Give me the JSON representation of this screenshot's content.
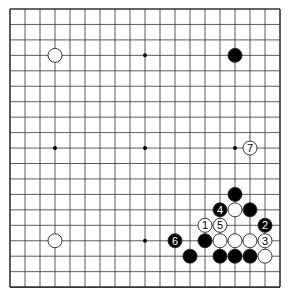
{
  "diagram": {
    "type": "go-board",
    "size": 19,
    "geometry": {
      "x0": 10,
      "y0": 9,
      "dx": 15.0,
      "dy": 15.45,
      "stone_radius": 7
    },
    "colors": {
      "background": "#ffffff",
      "line": "#333333",
      "black_stone": "#000000",
      "white_stone": "#ffffff",
      "stone_outline": "#222222"
    },
    "star_points": [
      [
        3,
        3
      ],
      [
        9,
        3
      ],
      [
        15,
        3
      ],
      [
        3,
        9
      ],
      [
        9,
        9
      ],
      [
        15,
        9
      ],
      [
        3,
        15
      ],
      [
        9,
        15
      ],
      [
        15,
        15
      ]
    ],
    "stones": [
      {
        "color": "white",
        "col": 3,
        "row": 3,
        "label": ""
      },
      {
        "color": "black",
        "col": 15,
        "row": 3,
        "label": ""
      },
      {
        "color": "white",
        "col": 16,
        "row": 9,
        "label": "7"
      },
      {
        "color": "white",
        "col": 3,
        "row": 15,
        "label": ""
      },
      {
        "color": "black",
        "col": 15,
        "row": 12,
        "label": ""
      },
      {
        "color": "black",
        "col": 14,
        "row": 13,
        "label": "4"
      },
      {
        "color": "white",
        "col": 15,
        "row": 13,
        "label": ""
      },
      {
        "color": "black",
        "col": 16,
        "row": 13,
        "label": ""
      },
      {
        "color": "white",
        "col": 13,
        "row": 14,
        "label": "1"
      },
      {
        "color": "white",
        "col": 14,
        "row": 14,
        "label": "5"
      },
      {
        "color": "black",
        "col": 17,
        "row": 14,
        "label": "2"
      },
      {
        "color": "black",
        "col": 11,
        "row": 15,
        "label": "6"
      },
      {
        "color": "black",
        "col": 13,
        "row": 15,
        "label": ""
      },
      {
        "color": "white",
        "col": 14,
        "row": 15,
        "label": ""
      },
      {
        "color": "white",
        "col": 15,
        "row": 15,
        "label": ""
      },
      {
        "color": "white",
        "col": 16,
        "row": 15,
        "label": ""
      },
      {
        "color": "white",
        "col": 17,
        "row": 15,
        "label": "3"
      },
      {
        "color": "black",
        "col": 12,
        "row": 16,
        "label": ""
      },
      {
        "color": "black",
        "col": 14,
        "row": 16,
        "label": ""
      },
      {
        "color": "black",
        "col": 15,
        "row": 16,
        "label": ""
      },
      {
        "color": "black",
        "col": 16,
        "row": 16,
        "label": ""
      },
      {
        "color": "white",
        "col": 17,
        "row": 16,
        "label": ""
      }
    ]
  }
}
